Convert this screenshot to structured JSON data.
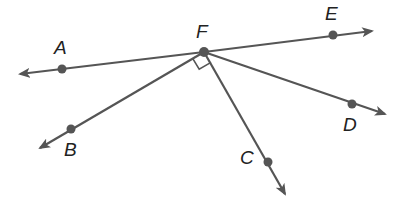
{
  "diagram": {
    "type": "geometry",
    "stroke_color": "#555555",
    "point_color": "#555555",
    "vertex": {
      "name": "F",
      "x": 204,
      "y": 52
    },
    "points": [
      {
        "name": "A",
        "x": 62,
        "y": 69,
        "label_x": 54,
        "label_y": 38
      },
      {
        "name": "E",
        "x": 333,
        "y": 35,
        "label_x": 325,
        "label_y": 4
      },
      {
        "name": "B",
        "x": 71,
        "y": 129,
        "label_x": 64,
        "label_y": 140
      },
      {
        "name": "C",
        "x": 268,
        "y": 162,
        "label_x": 240,
        "label_y": 148
      },
      {
        "name": "D",
        "x": 352,
        "y": 104,
        "label_x": 343,
        "label_y": 115
      },
      {
        "name": "F",
        "x": 204,
        "y": 52,
        "label_x": 196,
        "label_y": 22
      }
    ],
    "rays": [
      {
        "from": "F",
        "through": "A",
        "end_x": 18,
        "end_y": 74
      },
      {
        "from": "F",
        "through": "E",
        "end_x": 372,
        "end_y": 31
      },
      {
        "from": "F",
        "through": "B",
        "end_x": 40,
        "end_y": 148
      },
      {
        "from": "F",
        "through": "C",
        "end_x": 285,
        "end_y": 194
      },
      {
        "from": "F",
        "through": "D",
        "end_x": 385,
        "end_y": 114
      }
    ],
    "right_angle_marker": {
      "between": [
        "B",
        "C"
      ],
      "at": "F"
    }
  }
}
